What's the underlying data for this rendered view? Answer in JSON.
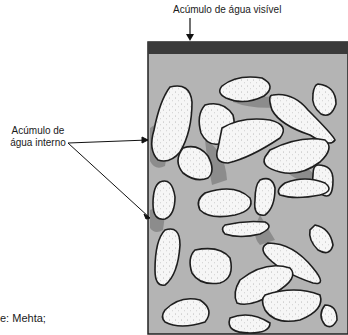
{
  "labels": {
    "top": "Acúmulo de água visível",
    "side_line1": "Acúmulo de",
    "side_line2": "água interno",
    "source": "e: Mehta;"
  },
  "colors": {
    "surface_water": "#3a3a3a",
    "paste": "#b4b4b4",
    "aggregate": "#f6f6f6",
    "outline": "#1e1e1e",
    "shadow": "#8a8a8a"
  }
}
